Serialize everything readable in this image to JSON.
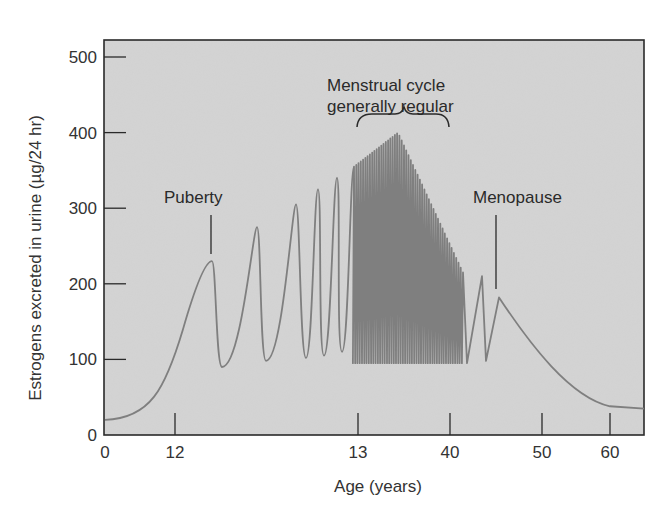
{
  "chart_data": {
    "type": "line",
    "title": "",
    "xlabel": "Age (years)",
    "ylabel": "Estrogens excreted in urine  (µg/24 hr)",
    "ylim": [
      0,
      500
    ],
    "y_ticks": [
      0,
      100,
      200,
      300,
      400,
      500
    ],
    "x_ticks": [
      {
        "label": "0",
        "px": 105
      },
      {
        "label": "12",
        "px": 175
      },
      {
        "label": "13",
        "px": 358
      },
      {
        "label": "40",
        "px": 450
      },
      {
        "label": "50",
        "px": 542
      },
      {
        "label": "60",
        "px": 610
      }
    ],
    "x_axis_note": "Non-linear age axis (0, 12, 13, 40, 50, 60)",
    "grid": false,
    "legend": null,
    "annotations": [
      {
        "text": "Puberty",
        "peak_value": 230
      },
      {
        "text": "Menstrual cycle",
        "line2": "generally regular",
        "type": "brace"
      },
      {
        "text": "Menopause",
        "peak_value": 182
      }
    ],
    "series": [
      {
        "name": "Estrogen excretion",
        "prepubertal_baseline": 20,
        "puberty_peaks": [
          230,
          275,
          305,
          325,
          340
        ],
        "puberty_troughs": [
          90,
          98,
          102,
          105,
          110
        ],
        "regular_cycle_peak_max": 400,
        "regular_cycle_trough": 95,
        "perimenopause_peaks": [
          210
        ],
        "menopause_peak": 182,
        "postmenopausal_baseline": 35
      }
    ]
  },
  "colors": {
    "plot_background": "#d4d4d4",
    "curve": "#7a7a7a",
    "frame": "#2a2a2a",
    "text": "#2a2a2a"
  }
}
